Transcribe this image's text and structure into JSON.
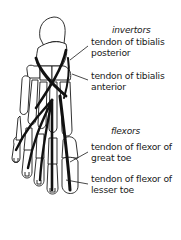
{
  "diagram": {
    "groups": [
      {
        "name": "invertors",
        "labels": [
          {
            "line1": "tendon of tibialis",
            "line2": "posterior"
          },
          {
            "line1": "tendon of tibialis",
            "line2": "anterior"
          }
        ]
      },
      {
        "name": "flexors",
        "labels": [
          {
            "line1": "tendon of flexor of",
            "line2": "great toe"
          },
          {
            "line1": "tendon of flexor of",
            "line2": "lesser toe"
          }
        ]
      }
    ],
    "colors": {
      "outline": "#1a1a1a",
      "tendon": "#111111",
      "background": "#ffffff"
    }
  }
}
